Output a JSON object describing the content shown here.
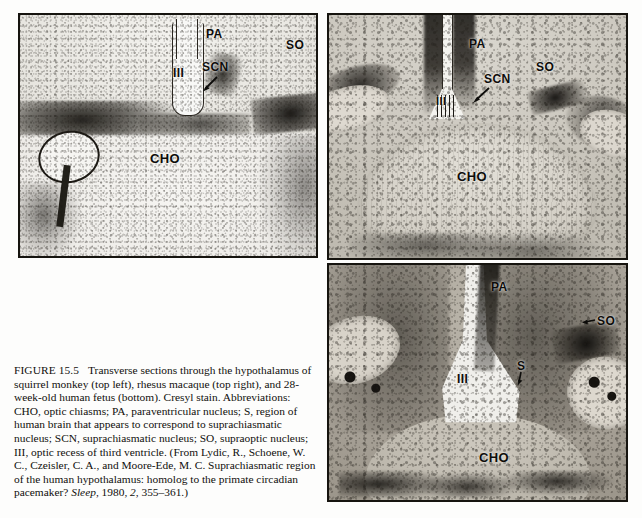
{
  "figure": {
    "number": "FIGURE 15.5",
    "caption_parts": {
      "p1": "Transverse sections through the hypothalamus of squirrel monkey (top left), rhesus macaque (top right), and 28-week-old human fetus (bottom). Cresyl stain. Abbreviations: CHO, optic chiasms; PA, paraventricular nucleus; S, region of human brain that appears to correspond to suprachiasmatic nucleus; SCN, suprachiasmatic nucleus; SO, supraoptic nucleus; III, optic recess of third ventricle. (From Lydic, R., Schoene, W. C., Czeisler, C. A., and Moore-Ede, M. C. Suprachiasmatic region of the human hypothalamus: homolog to the primate circadian pacemaker? ",
      "journal": "Sleep",
      "p2": ", 1980, ",
      "volume": "2",
      "p3": ", 355–361.)"
    }
  },
  "panels": [
    {
      "id": "top-left",
      "species": "squirrel monkey",
      "labels": [
        {
          "text": "PA",
          "name": "label-pa"
        },
        {
          "text": "III",
          "name": "label-iii"
        },
        {
          "text": "SCN",
          "name": "label-scn"
        },
        {
          "text": "SO",
          "name": "label-so"
        },
        {
          "text": "CHO",
          "name": "label-cho"
        }
      ]
    },
    {
      "id": "top-right",
      "species": "rhesus macaque",
      "labels": [
        {
          "text": "PA",
          "name": "label-pa"
        },
        {
          "text": "III",
          "name": "label-iii"
        },
        {
          "text": "SCN",
          "name": "label-scn"
        },
        {
          "text": "SO",
          "name": "label-so"
        },
        {
          "text": "CHO",
          "name": "label-cho"
        }
      ]
    },
    {
      "id": "bottom-right",
      "species": "28-week-old human fetus",
      "labels": [
        {
          "text": "PA",
          "name": "label-pa"
        },
        {
          "text": "III",
          "name": "label-iii"
        },
        {
          "text": "S",
          "name": "label-s"
        },
        {
          "text": "SO",
          "name": "label-so"
        },
        {
          "text": "CHO",
          "name": "label-cho"
        }
      ]
    }
  ],
  "abbreviations": {
    "CHO": "optic chiasms",
    "PA": "paraventricular nucleus",
    "S": "region of human brain that appears to correspond to suprachiasmatic nucleus",
    "SCN": "suprachiasmatic nucleus",
    "SO": "supraoptic nucleus",
    "III": "optic recess of third ventricle"
  },
  "colors": {
    "page_background": "#fdfdfc",
    "panel_border": "#16140f",
    "tissue_light": "#e9e7e1",
    "tissue_dark": "#24211b",
    "text": "#100f0c"
  }
}
